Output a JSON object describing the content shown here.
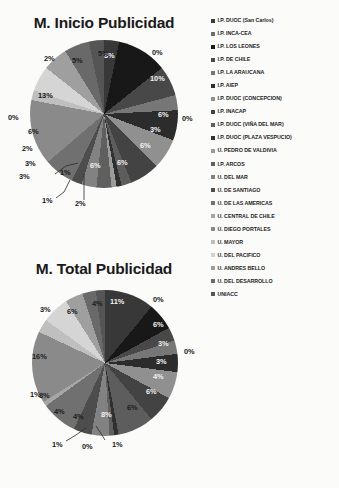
{
  "document": {
    "background_color": "#fbfbfa",
    "text_color": "#1a1a1a"
  },
  "legend": {
    "position": "right",
    "items": [
      {
        "label": "I.P. DUOC (San Carlos)",
        "color": "#3b3b3b"
      },
      {
        "label": "I.P. INCA-CEA",
        "color": "#6e6e6e"
      },
      {
        "label": "I.P. LOS LEONES",
        "color": "#1c1c1c"
      },
      {
        "label": "I.P. DE CHILE",
        "color": "#4a4a4a"
      },
      {
        "label": "I.P. LA ARAUCANA",
        "color": "#777777"
      },
      {
        "label": "I.P. AIEP",
        "color": "#2f2f2f"
      },
      {
        "label": "I.P. DUOC (CONCEPCION)",
        "color": "#8f8f8f"
      },
      {
        "label": "I.P. INACAP",
        "color": "#454545"
      },
      {
        "label": "I.P. DUOC (VIÑA DEL MAR)",
        "color": "#5e5e5e"
      },
      {
        "label": "I.P. DUOC (PLAZA VESPUCIO)",
        "color": "#333333"
      },
      {
        "label": "U. PEDRO DE VALDIVIA",
        "color": "#9a9a9a"
      },
      {
        "label": "I.P. ARCOS",
        "color": "#606060"
      },
      {
        "label": "U. DEL MAR",
        "color": "#828282"
      },
      {
        "label": "U. DE SANTIAGO",
        "color": "#4f4f4f"
      },
      {
        "label": "U. DE LAS AMERICAS",
        "color": "#717171"
      },
      {
        "label": "U. CENTRAL DE CHILE",
        "color": "#a5a5a5"
      },
      {
        "label": "U. DIEGO PORTALES",
        "color": "#8a8a8a"
      },
      {
        "label": "U. MAYOR",
        "color": "#bdbdbd"
      },
      {
        "label": "U. DEL PACIFICO",
        "color": "#d2d2d2"
      },
      {
        "label": "U. ANDRES BELLO",
        "color": "#9e9e9e"
      },
      {
        "label": "U. DEL DESARROLLO",
        "color": "#6a6a6a"
      },
      {
        "label": "UNIACC",
        "color": "#575757"
      }
    ]
  },
  "chart_data": [
    {
      "type": "pie",
      "title": "M. Inicio Publicidad",
      "xlabel": "",
      "ylabel": "",
      "legend_position": "right",
      "categories": [
        "I.P. DUOC (San Carlos)",
        "I.P. INCA-CEA",
        "I.P. LOS LEONES",
        "I.P. DE CHILE",
        "I.P. LA ARAUCANA",
        "I.P. AIEP",
        "I.P. DUOC (CONCEPCION)",
        "I.P. INACAP",
        "I.P. DUOC (VIÑA DEL MAR)",
        "I.P. DUOC (PLAZA VESPUCIO)",
        "U. PEDRO DE VALDIVIA",
        "I.P. ARCOS",
        "U. DEL MAR",
        "U. DE SANTIAGO",
        "U. DE LAS AMERICAS",
        "U. CENTRAL DE CHILE",
        "U. DIEGO PORTALES",
        "U. MAYOR",
        "U. DEL PACIFICO",
        "U. ANDRES BELLO",
        "U. DEL DESARROLLO",
        "UNIACC"
      ],
      "values": [
        3,
        0,
        10,
        6,
        3,
        6,
        6,
        6,
        2,
        1,
        1,
        3,
        3,
        2,
        6,
        0,
        13,
        2,
        5,
        5,
        5,
        3
      ],
      "labels": [
        "3%",
        "0%",
        "10%",
        "6%",
        "3%",
        "6%",
        "6%",
        "6%",
        "2%",
        "1%",
        "1%",
        "3%",
        "3%",
        "2%",
        "6%",
        "0%",
        "13%",
        "2%",
        "5%",
        "5%",
        "5%",
        "3%"
      ]
    },
    {
      "type": "pie",
      "title": "M. Total Publicidad",
      "xlabel": "",
      "ylabel": "",
      "legend_position": "right",
      "categories": [
        "I.P. DUOC (San Carlos)",
        "I.P. INCA-CEA",
        "I.P. LOS LEONES",
        "I.P. DE CHILE",
        "I.P. LA ARAUCANA",
        "I.P. AIEP",
        "I.P. DUOC (CONCEPCION)",
        "I.P. INACAP",
        "I.P. DUOC (VIÑA DEL MAR)",
        "I.P. DUOC (PLAZA VESPUCIO)",
        "U. PEDRO DE VALDIVIA",
        "I.P. ARCOS",
        "U. DEL MAR",
        "U. DE SANTIAGO",
        "U. DE LAS AMERICAS",
        "U. CENTRAL DE CHILE",
        "U. DIEGO PORTALES",
        "U. MAYOR",
        "U. DEL PACIFICO",
        "U. ANDRES BELLO",
        "U. DEL DESARROLLO",
        "UNIACC"
      ],
      "values": [
        11,
        0,
        6,
        3,
        3,
        4,
        6,
        6,
        8,
        1,
        0,
        1,
        4,
        4,
        8,
        1,
        16,
        3,
        6,
        4,
        3,
        2
      ],
      "labels": [
        "11%",
        "0%",
        "6%",
        "3%",
        "3%",
        "4%",
        "6%",
        "6%",
        "8%",
        "1%",
        "0%",
        "1%",
        "4%",
        "4%",
        "8%",
        "1%",
        "16%",
        "3%",
        "6%",
        "4%",
        "3%",
        "2%"
      ]
    }
  ],
  "chart1": {
    "title": "M. Inicio Publicidad",
    "pct_labels": [
      {
        "t": "3%",
        "x": 104,
        "y": 20,
        "tone": "light"
      },
      {
        "t": "0%",
        "x": 152,
        "y": 17,
        "tone": "dark"
      },
      {
        "t": "10%",
        "x": 150,
        "y": 43,
        "tone": "light"
      },
      {
        "t": "6%",
        "x": 158,
        "y": 79,
        "tone": "light"
      },
      {
        "t": "3%",
        "x": 150,
        "y": 94,
        "tone": "light"
      },
      {
        "t": "6%",
        "x": 140,
        "y": 110,
        "tone": "light"
      },
      {
        "t": "6%",
        "x": 117,
        "y": 127,
        "tone": "light"
      },
      {
        "t": "6%",
        "x": 90,
        "y": 130,
        "tone": "light"
      },
      {
        "t": "0%",
        "x": 182,
        "y": 83,
        "tone": "dark"
      },
      {
        "t": "1%",
        "x": 60,
        "y": 137,
        "tone": "dark"
      },
      {
        "t": "1%",
        "x": 42,
        "y": 165,
        "tone": "dark"
      },
      {
        "t": "2%",
        "x": 75,
        "y": 168,
        "tone": "dark"
      },
      {
        "t": "3%",
        "x": 19,
        "y": 141,
        "tone": "dark"
      },
      {
        "t": "3%",
        "x": 25,
        "y": 128,
        "tone": "dark"
      },
      {
        "t": "2%",
        "x": 22,
        "y": 113,
        "tone": "dark"
      },
      {
        "t": "6%",
        "x": 28,
        "y": 96,
        "tone": "dark"
      },
      {
        "t": "0%",
        "x": 8,
        "y": 82,
        "tone": "dark"
      },
      {
        "t": "13%",
        "x": 38,
        "y": 60,
        "tone": "dark"
      },
      {
        "t": "2%",
        "x": 44,
        "y": 23,
        "tone": "dark"
      },
      {
        "t": "5%",
        "x": 72,
        "y": 25,
        "tone": "dark"
      },
      {
        "t": "5%",
        "x": 98,
        "y": 18,
        "tone": "dark"
      }
    ]
  },
  "chart2": {
    "title": "M. Total Publicidad",
    "pct_labels": [
      {
        "t": "11%",
        "x": 110,
        "y": 20,
        "tone": "light"
      },
      {
        "t": "0%",
        "x": 153,
        "y": 18,
        "tone": "dark"
      },
      {
        "t": "6%",
        "x": 153,
        "y": 43,
        "tone": "light"
      },
      {
        "t": "3%",
        "x": 158,
        "y": 62,
        "tone": "light"
      },
      {
        "t": "0%",
        "x": 184,
        "y": 70,
        "tone": "dark"
      },
      {
        "t": "3%",
        "x": 156,
        "y": 80,
        "tone": "light"
      },
      {
        "t": "4%",
        "x": 153,
        "y": 95,
        "tone": "light"
      },
      {
        "t": "6%",
        "x": 146,
        "y": 110,
        "tone": "light"
      },
      {
        "t": "6%",
        "x": 127,
        "y": 126,
        "tone": "dark"
      },
      {
        "t": "8%",
        "x": 101,
        "y": 133,
        "tone": "light"
      },
      {
        "t": "1%",
        "x": 112,
        "y": 163,
        "tone": "dark"
      },
      {
        "t": "0%",
        "x": 82,
        "y": 165,
        "tone": "dark"
      },
      {
        "t": "1%",
        "x": 52,
        "y": 163,
        "tone": "dark"
      },
      {
        "t": "4%",
        "x": 73,
        "y": 135,
        "tone": "dark"
      },
      {
        "t": "4%",
        "x": 54,
        "y": 130,
        "tone": "dark"
      },
      {
        "t": "1%",
        "x": 30,
        "y": 113,
        "tone": "dark"
      },
      {
        "t": "8%",
        "x": 39,
        "y": 114,
        "tone": "dark"
      },
      {
        "t": "16%",
        "x": 32,
        "y": 75,
        "tone": "dark"
      },
      {
        "t": "3%",
        "x": 40,
        "y": 28,
        "tone": "dark"
      },
      {
        "t": "6%",
        "x": 67,
        "y": 30,
        "tone": "dark"
      },
      {
        "t": "4%",
        "x": 92,
        "y": 22,
        "tone": "dark"
      }
    ]
  }
}
